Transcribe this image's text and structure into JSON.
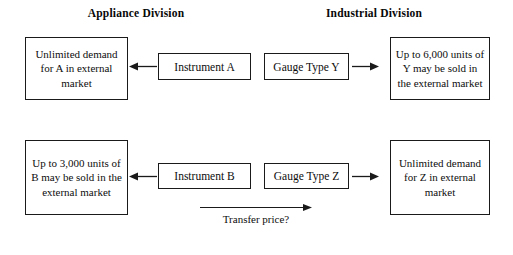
{
  "headers": {
    "left": "Appliance Division",
    "right": "Industrial Division"
  },
  "nodes": {
    "unlimited_a": "Unlimited demand for A in external market",
    "upto_6000_y": "Up to 6,000 units of Y may be sold in the external market",
    "instrument_a": "Instrument A",
    "gauge_y": "Gauge Type Y",
    "upto_3000_b": "Up to 3,000 units of B may be sold in the external market",
    "unlimited_z": "Unlimited demand for Z in external market",
    "instrument_b": "Instrument B",
    "gauge_z": "Gauge Type Z"
  },
  "annotations": {
    "transfer_price": "Transfer price?"
  },
  "colors": {
    "background": "#ffffff",
    "text": "#0d0d0d",
    "border": "#1a1a1a",
    "arrow": "#1a1a1a"
  }
}
